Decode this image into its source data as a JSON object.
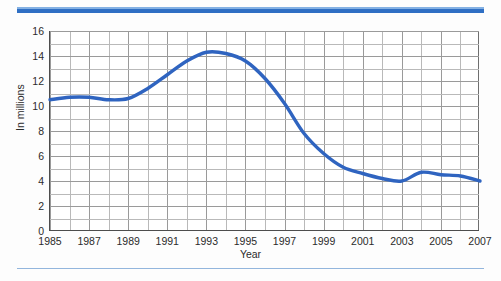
{
  "figure": {
    "accent_color": "#2f6fc4",
    "line_color": "#2f64c0",
    "grid_color": "#9a9a9a",
    "axis_color": "#4d4d4d",
    "background": "#ffffff"
  },
  "chart_data": {
    "type": "line",
    "title": "",
    "xlabel": "Year",
    "ylabel": "In millions",
    "xlim": [
      1985,
      2007
    ],
    "ylim": [
      0,
      16
    ],
    "grid": true,
    "legend": "none",
    "y_ticks": [
      0,
      2,
      4,
      6,
      8,
      10,
      12,
      14,
      16
    ],
    "y_tick_labels": [
      "0",
      "2",
      "4",
      "6",
      "8",
      "10",
      "12",
      "14",
      "16"
    ],
    "y_minor_step": 1,
    "x_ticks": [
      1985,
      1987,
      1989,
      1991,
      1993,
      1995,
      1997,
      1999,
      2001,
      2003,
      2005,
      2007
    ],
    "x_tick_labels": [
      "1985",
      "1987",
      "1989",
      "1991",
      "1993",
      "1995",
      "1997",
      "1999",
      "2001",
      "2003",
      "2005",
      "2007"
    ],
    "x_minor_step": 1,
    "x": [
      1985,
      1986,
      1987,
      1988,
      1989,
      1990,
      1991,
      1992,
      1993,
      1994,
      1995,
      1996,
      1997,
      1998,
      1999,
      2000,
      2001,
      2002,
      2003,
      2004,
      2005,
      2006,
      2007
    ],
    "values": [
      10.5,
      10.7,
      10.7,
      10.5,
      10.6,
      11.4,
      12.5,
      13.6,
      14.3,
      14.2,
      13.6,
      12.2,
      10.2,
      7.8,
      6.2,
      5.1,
      4.6,
      4.2,
      4.0,
      4.7,
      4.5,
      4.4,
      4.0
    ],
    "series": [
      {
        "name": "In millions",
        "values": [
          10.5,
          10.7,
          10.7,
          10.5,
          10.6,
          11.4,
          12.5,
          13.6,
          14.3,
          14.2,
          13.6,
          12.2,
          10.2,
          7.8,
          6.2,
          5.1,
          4.6,
          4.2,
          4.0,
          4.7,
          4.5,
          4.4,
          4.0
        ]
      }
    ]
  }
}
